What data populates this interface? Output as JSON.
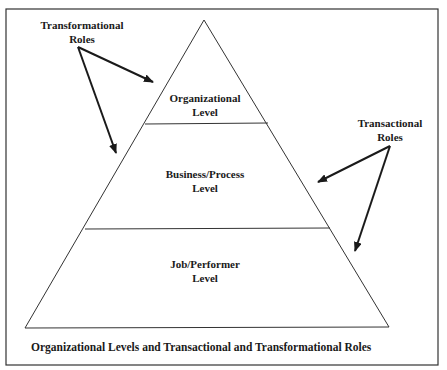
{
  "diagram": {
    "type": "pyramid",
    "levels": [
      {
        "name": "Organizational Level",
        "line1": "Organizational",
        "line2": "Level"
      },
      {
        "name": "Business/Process Level",
        "line1": "Business/Process",
        "line2": "Level"
      },
      {
        "name": "Job/Performer Level",
        "line1": "Job/Performer",
        "line2": "Level"
      }
    ],
    "annotations": [
      {
        "name": "Transformational Roles",
        "line1": "Transformational",
        "line2": "Roles",
        "points_to": [
          "Organizational Level",
          "Business/Process Level"
        ]
      },
      {
        "name": "Transactional Roles",
        "line1": "Transactional",
        "line2": "Roles",
        "points_to": [
          "Business/Process Level",
          "Job/Performer Level"
        ]
      }
    ],
    "caption": "Organizational Levels and Transactional and Transformational Roles",
    "colors": {
      "stroke": "#1a1a1a",
      "background": "#ffffff"
    }
  }
}
